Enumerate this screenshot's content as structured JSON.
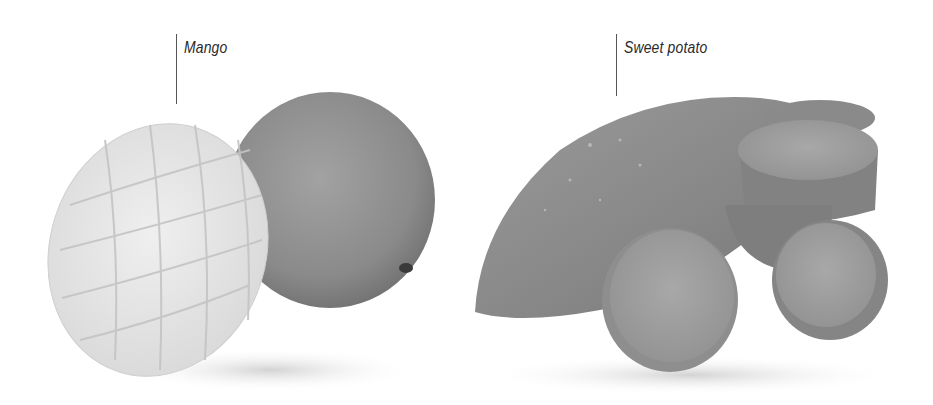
{
  "labels": {
    "mango": "Mango",
    "sweet_potato": "Sweet potato"
  },
  "items": [
    {
      "name": "Mango",
      "depiction": "halved mango cut in a hedgehog crosshatch beside a whole mango"
    },
    {
      "name": "Sweet potato",
      "depiction": "whole sweet potato with several round cut slices"
    }
  ],
  "colors": {
    "background": "#ffffff",
    "label_text": "#2a2a2a",
    "leader_line": "#555555",
    "mango_flesh": "#e6e6e6",
    "mango_skin": "#8d8d8d",
    "sweet_potato_skin": "#8a8a8a",
    "sweet_potato_flesh": "#9e9e9e"
  }
}
